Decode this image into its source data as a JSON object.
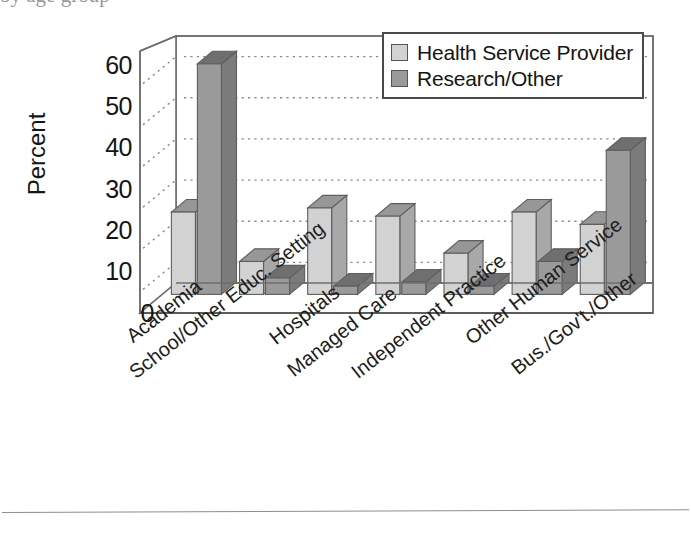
{
  "figure": {
    "top_cut_text": "by age group",
    "bottom_rule": "horizontal-rule"
  },
  "legend": {
    "position": "top-right",
    "entries": [
      {
        "label": "Health Service Provider",
        "color": "#d2d2d2",
        "swatch_name": "legend-swatch-health-service-provider"
      },
      {
        "label": "Research/Other",
        "color": "#9a9a9a",
        "swatch_name": "legend-swatch-research-other"
      }
    ]
  },
  "chart_data": {
    "type": "bar",
    "title": "",
    "subtitle": "",
    "xlabel": "",
    "ylabel": "Percent",
    "ylim": [
      0,
      60
    ],
    "yticks": [
      0,
      10,
      20,
      30,
      40,
      50,
      60
    ],
    "ytick_labels": [
      "0",
      "10",
      "20",
      "30",
      "40",
      "50",
      "60"
    ],
    "grid": true,
    "grid_style": "dotted-horizontal",
    "three_d": true,
    "legend_position": "top-right",
    "categories": [
      "Academia",
      "School/Other Educ. Setting",
      "Hospitals",
      "Managed Care",
      "Independent Practice",
      "Other Human Service",
      "Bus./Gov't./Other"
    ],
    "series": [
      {
        "name": "Health Service Provider",
        "color": "#d2d2d2",
        "values": [
          20,
          8,
          21,
          19,
          10,
          20,
          17
        ]
      },
      {
        "name": "Research/Other",
        "color": "#9a9a9a",
        "values": [
          56,
          4,
          2,
          3,
          2,
          8,
          35
        ]
      }
    ]
  }
}
